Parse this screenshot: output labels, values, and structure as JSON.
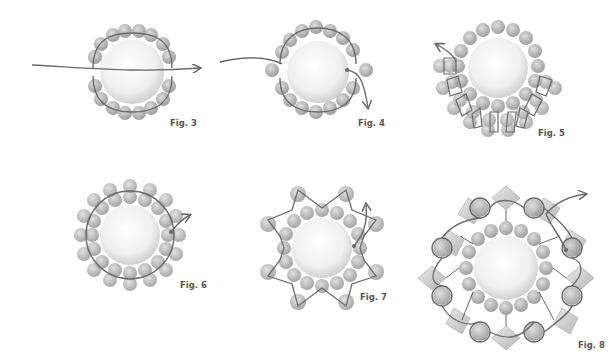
{
  "figures": [
    {
      "id": "fig3",
      "label": "Fig. 3",
      "description": "Two arcs of seed beads around a large pearl, thread passing through center horizontally with arrow to the right"
    },
    {
      "id": "fig4",
      "label": "Fig. 4",
      "description": "Arcs joined with side beads, thread exits downward with arrow"
    },
    {
      "id": "fig5",
      "label": "Fig. 5",
      "description": "Ring of beads around pearl with loop picots added around lower half, arrow exits upper left"
    },
    {
      "id": "fig6",
      "label": "Fig. 6",
      "description": "Complete double ring of beads around pearl, thread exits right with arrow"
    },
    {
      "id": "fig7",
      "label": "Fig. 7",
      "description": "Star-shaped points of beads around ring, arrow exits up on right"
    },
    {
      "id": "fig8",
      "label": "Fig. 8",
      "description": "Bicone crystals and bead clusters around ring, arrow exits upper right"
    }
  ],
  "colors": {
    "bead": "#9a9a9a",
    "bead_light": "#c4c4c4",
    "thread": "#6b6b6b",
    "pearl_center": "#ffffff",
    "pearl_edge": "#d6d6d6",
    "label": "#555555"
  }
}
